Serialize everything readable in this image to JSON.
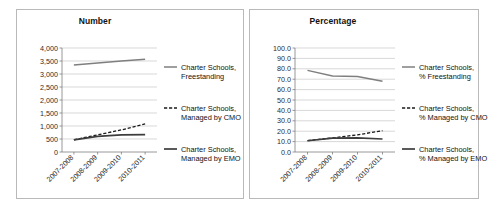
{
  "figure": {
    "panels": [
      "number",
      "percentage"
    ]
  },
  "chart_data": [
    {
      "id": "number",
      "type": "line",
      "title": "Number",
      "xlabel": "",
      "ylabel": "",
      "x": [
        "2007-2008",
        "2008-2009",
        "2009-2010",
        "2010-2011"
      ],
      "ylim": [
        0,
        4000
      ],
      "yticks": [
        "0",
        "500",
        "1,000",
        "1,500",
        "2,000",
        "2,500",
        "3,000",
        "3,500",
        "4,000"
      ],
      "ytick_values": [
        0,
        500,
        1000,
        1500,
        2000,
        2500,
        3000,
        3500,
        4000
      ],
      "grid": true,
      "legend_position": "right",
      "series": [
        {
          "name": "Charter Schools, Freestanding",
          "style": "solid-gray",
          "color": "#7f7f7f",
          "values": [
            3350,
            3420,
            3500,
            3570
          ]
        },
        {
          "name": "Charter Schools, Managed by CMO",
          "style": "dashed-black",
          "color": "#1a1a1a",
          "values": [
            470,
            660,
            850,
            1080
          ]
        },
        {
          "name": "Charter Schools, Managed by EMO",
          "style": "solid-black",
          "color": "#3d3d3d",
          "values": [
            465,
            600,
            660,
            670
          ]
        }
      ]
    },
    {
      "id": "percentage",
      "type": "line",
      "title": "Percentage",
      "xlabel": "",
      "ylabel": "",
      "x": [
        "2007-2008",
        "2008-2009",
        "2009-2010",
        "2010-2011"
      ],
      "ylim": [
        0,
        100
      ],
      "yticks": [
        "0.0",
        "10.0",
        "20.0",
        "30.0",
        "40.0",
        "50.0",
        "60.0",
        "70.0",
        "80.0",
        "90.0",
        "100.0"
      ],
      "ytick_values": [
        0,
        10,
        20,
        30,
        40,
        50,
        60,
        70,
        80,
        90,
        100
      ],
      "grid": true,
      "legend_position": "right",
      "series": [
        {
          "name": "Charter Schools, % Freestanding",
          "style": "solid-gray",
          "color": "#7f7f7f",
          "values": [
            78.5,
            73.0,
            72.5,
            68.0
          ]
        },
        {
          "name": "Charter Schools, % Managed by CMO",
          "style": "dashed-black",
          "color": "#1a1a1a",
          "values": [
            11.0,
            13.5,
            16.5,
            20.5
          ]
        },
        {
          "name": "Charter Schools, % Managed by EMO",
          "style": "solid-black",
          "color": "#3d3d3d",
          "values": [
            10.8,
            13.3,
            13.5,
            12.5
          ]
        }
      ]
    }
  ]
}
